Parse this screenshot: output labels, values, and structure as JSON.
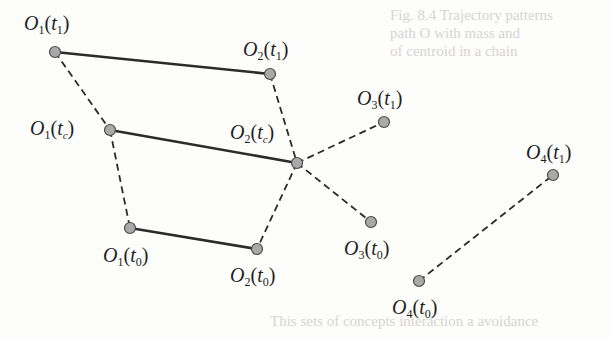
{
  "diagram": {
    "colors": {
      "background": "#fdfdfb",
      "node_fill": "#a9a9a9",
      "node_stroke": "#4a4a4a",
      "solid_edge": "#2b2b2b",
      "dashed_edge": "#2b2b2b",
      "label": "#1e1e1e",
      "bleed_text": "#cfcfcc"
    },
    "nodes": [
      {
        "id": "O1_t1",
        "obj": "O",
        "obj_sub": "1",
        "time": "t",
        "time_sub": "1",
        "x": 55,
        "y": 52,
        "label_x": 24,
        "label_y": 12
      },
      {
        "id": "O2_t1",
        "obj": "O",
        "obj_sub": "2",
        "time": "t",
        "time_sub": "1",
        "x": 270,
        "y": 74,
        "label_x": 243,
        "label_y": 38
      },
      {
        "id": "O1_tc",
        "obj": "O",
        "obj_sub": "1",
        "time": "t",
        "time_sub": "c",
        "x": 110,
        "y": 130,
        "label_x": 30,
        "label_y": 117
      },
      {
        "id": "O2_tc",
        "obj": "O",
        "obj_sub": "2",
        "time": "t",
        "time_sub": "c",
        "x": 297,
        "y": 163,
        "label_x": 230,
        "label_y": 121
      },
      {
        "id": "O3_t1",
        "obj": "O",
        "obj_sub": "3",
        "time": "t",
        "time_sub": "1",
        "x": 384,
        "y": 122,
        "label_x": 357,
        "label_y": 87
      },
      {
        "id": "O1_t0",
        "obj": "O",
        "obj_sub": "1",
        "time": "t",
        "time_sub": "0",
        "x": 130,
        "y": 228,
        "label_x": 103,
        "label_y": 244
      },
      {
        "id": "O2_t0",
        "obj": "O",
        "obj_sub": "2",
        "time": "t",
        "time_sub": "0",
        "x": 257,
        "y": 249,
        "label_x": 230,
        "label_y": 264
      },
      {
        "id": "O3_t0",
        "obj": "O",
        "obj_sub": "3",
        "time": "t",
        "time_sub": "0",
        "x": 371,
        "y": 222,
        "label_x": 344,
        "label_y": 237
      },
      {
        "id": "O4_t1",
        "obj": "O",
        "obj_sub": "4",
        "time": "t",
        "time_sub": "1",
        "x": 553,
        "y": 175,
        "label_x": 526,
        "label_y": 141
      },
      {
        "id": "O4_t0",
        "obj": "O",
        "obj_sub": "4",
        "time": "t",
        "time_sub": "0",
        "x": 419,
        "y": 281,
        "label_x": 392,
        "label_y": 296
      }
    ],
    "edges": [
      {
        "from": "O1_t1",
        "to": "O2_t1",
        "style": "solid"
      },
      {
        "from": "O1_tc",
        "to": "O2_tc",
        "style": "solid"
      },
      {
        "from": "O1_t0",
        "to": "O2_t0",
        "style": "solid"
      },
      {
        "from": "O1_t1",
        "to": "O1_tc",
        "style": "dashed"
      },
      {
        "from": "O1_tc",
        "to": "O1_t0",
        "style": "dashed"
      },
      {
        "from": "O2_t1",
        "to": "O2_tc",
        "style": "dashed"
      },
      {
        "from": "O2_tc",
        "to": "O2_t0",
        "style": "dashed"
      },
      {
        "from": "O2_tc",
        "to": "O3_t1",
        "style": "dashed"
      },
      {
        "from": "O2_tc",
        "to": "O3_t0",
        "style": "dashed"
      },
      {
        "from": "O4_t0",
        "to": "O4_t1",
        "style": "dashed"
      }
    ]
  },
  "bleed_through": {
    "top_lines": [
      "Fig. 8.4  Trajectory patterns",
      "path   O  with mass and",
      "of centroid in a chain"
    ],
    "bottom_line": "This sets of concepts   interaction   a   avoidance"
  }
}
